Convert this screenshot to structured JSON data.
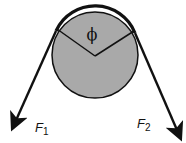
{
  "diagram": {
    "type": "capstan-belt-friction",
    "angle_label": "ϕ",
    "forces": [
      {
        "name": "F",
        "subscript": "1",
        "side": "left"
      },
      {
        "name": "F",
        "subscript": "2",
        "side": "right"
      }
    ],
    "colors": {
      "pulley_fill": "#a9a9a9",
      "stroke": "#111111",
      "background": "#ffffff"
    }
  }
}
